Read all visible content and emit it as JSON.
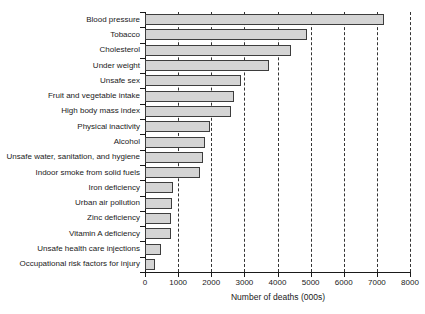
{
  "chart_data": {
    "type": "bar",
    "orientation": "horizontal",
    "title": "",
    "xlabel": "Number of deaths (000s)",
    "ylabel": "",
    "xlim": [
      0,
      8000
    ],
    "xticks": [
      0,
      1000,
      2000,
      3000,
      4000,
      5000,
      6000,
      7000,
      8000
    ],
    "xticklabels": [
      "0",
      "1000",
      "2000",
      "3000",
      "4000",
      "5000",
      "6000",
      "7000",
      "8000"
    ],
    "grid": "vertical-dashed",
    "legend": null,
    "categories": [
      "Blood pressure",
      "Tobacco",
      "Cholesterol",
      "Under weight",
      "Unsafe sex",
      "Fruit and vegetable intake",
      "High body mass index",
      "Physical inactivity",
      "Alcohol",
      "Unsafe water, sanitation, and hygiene",
      "Indoor  smoke  from solid fuels",
      "Iron deficiency",
      "Urban air pollution",
      "Zinc deficiency",
      "Vitamin A deficiency",
      "Unsafe health care injections",
      "Occupational risk factors for injury"
    ],
    "values": [
      7200,
      4900,
      4400,
      3750,
      2900,
      2700,
      2600,
      1950,
      1800,
      1750,
      1650,
      860,
      800,
      790,
      770,
      480,
      310
    ],
    "bar_fill": "#d4d4d4",
    "bar_edge": "#3d3d3d"
  },
  "axis": {
    "line_color": "#1a1a1a",
    "grid_color": "#333333"
  }
}
